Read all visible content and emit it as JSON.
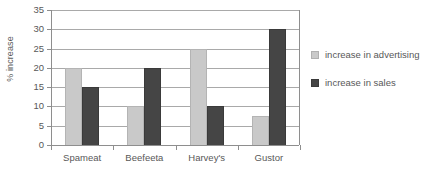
{
  "chart_data": {
    "type": "bar",
    "title": "",
    "subtitle": "",
    "xlabel": "",
    "ylabel": "% increase",
    "ylim": [
      0,
      35
    ],
    "ytick_step": 5,
    "yticks": [
      "0",
      "5",
      "10",
      "15",
      "20",
      "25",
      "30",
      "35"
    ],
    "grid": true,
    "legend_position": "right",
    "categories": [
      "Spameat",
      "Beefeeta",
      "Harvey's",
      "Gustor"
    ],
    "series": [
      {
        "name": "increase in advertising",
        "color": "#c9c9c9",
        "values": [
          20,
          10,
          25,
          7.5
        ]
      },
      {
        "name": "increase in sales",
        "color": "#454545",
        "values": [
          15,
          20,
          10,
          30
        ]
      }
    ]
  },
  "legend": {
    "items": [
      {
        "label": "increase in advertising"
      },
      {
        "label": "increase in sales"
      }
    ]
  },
  "colors": {
    "advertising": "#c9c9c9",
    "sales": "#454545",
    "gridline": "#a9a9a9",
    "axis": "#8e8e8e",
    "text": "#585858",
    "background": "#ffffff"
  }
}
